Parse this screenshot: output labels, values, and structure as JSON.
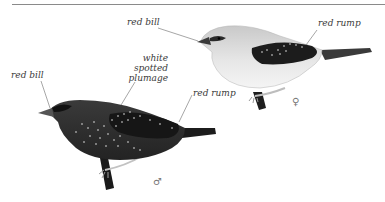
{
  "figure": {
    "female": {
      "sex_symbol": "♀",
      "labels": {
        "bill": "red bill",
        "rump": "red rump"
      }
    },
    "male": {
      "sex_symbol": "♂",
      "labels": {
        "bill": "red bill",
        "plumage_line1": "white",
        "plumage_line2": "spotted",
        "plumage_line3": "plumage",
        "rump": "red rump"
      }
    }
  },
  "colors": {
    "rule": "#8a8a8a",
    "label_text": "#3a3a3a",
    "female_body": "#d9d9d9",
    "female_wing": "#1c1c1c",
    "male_body": "#2e2e2e",
    "spots": "#e8e8e8"
  }
}
